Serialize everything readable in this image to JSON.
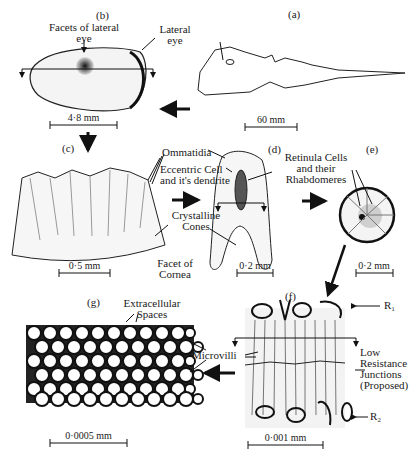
{
  "figure": {
    "panels": {
      "a": {
        "letter": "(a)",
        "scale": "60 mm",
        "labels": {
          "lateral_eye": "Lateral eye"
        }
      },
      "b": {
        "letter": "(b)",
        "scale": "4·8 mm",
        "labels": {
          "facets": "Facets of lateral eye"
        }
      },
      "c": {
        "letter": "(c)",
        "scale": "0·5 mm",
        "labels": {
          "ommatidia": "Ommatidia",
          "facet": "Facet of Cornea"
        }
      },
      "d": {
        "letter": "(d)",
        "scale": "0·2 mm",
        "labels": {
          "eccentric": "Eccentric Cell and it's dendrite",
          "cones": "Crystalline Cones"
        }
      },
      "e": {
        "letter": "(e)",
        "scale": "0·2 mm",
        "labels": {
          "retinula": "Retinula Cells and their Rhabdomeres"
        }
      },
      "f": {
        "letter": "(f)",
        "scale": "0·001 mm",
        "labels": {
          "r1": "R₁",
          "r2": "R₂",
          "junctions": "Low Resistance Junctions (Proposed)"
        }
      },
      "g": {
        "letter": "(g)",
        "scale": "0·0005 mm",
        "labels": {
          "extracellular": "Extracellular Spaces",
          "microvilli": "Microvilli"
        }
      }
    }
  }
}
